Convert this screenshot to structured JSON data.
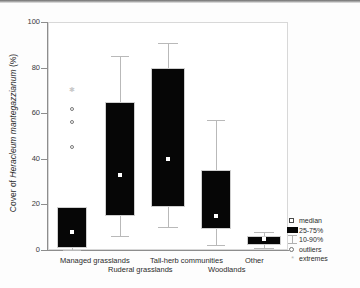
{
  "chart_data": {
    "type": "box",
    "title": "",
    "xlabel": "",
    "ylabel": "Cover of Heracleum mantegazzianum (%)",
    "ylabel_parts": {
      "prefix": "Cover of ",
      "italic": "Heracleum mantegazzianum",
      "suffix": " (%)"
    },
    "ylim": [
      0,
      100
    ],
    "yticks": [
      0,
      20,
      40,
      60,
      80,
      100
    ],
    "ytick_labels": [
      "0",
      "20",
      "40",
      "60",
      "80",
      "100"
    ],
    "grid": false,
    "legend_position": "right-bottom",
    "categories": [
      "Managed grasslands",
      "Ruderal grasslands",
      "Tall-herb communities",
      "Woodlands",
      "Other"
    ],
    "boxes": [
      {
        "category": "Managed grasslands",
        "median": 8,
        "q25": 1,
        "q75": 19,
        "p10": 0,
        "p90": 19,
        "outliers": [
          45,
          56,
          62
        ],
        "extremes": [
          70
        ]
      },
      {
        "category": "Ruderal grasslands",
        "median": 33,
        "q25": 15,
        "q75": 65,
        "p10": 6,
        "p90": 85,
        "outliers": [],
        "extremes": []
      },
      {
        "category": "Tall-herb communities",
        "median": 40,
        "q25": 19,
        "q75": 80,
        "p10": 10,
        "p90": 91,
        "outliers": [],
        "extremes": []
      },
      {
        "category": "Woodlands",
        "median": 15,
        "q25": 9,
        "q75": 35,
        "p10": 2,
        "p90": 57,
        "outliers": [],
        "extremes": []
      },
      {
        "category": "Other",
        "median": 5,
        "q25": 2,
        "q75": 6,
        "p10": 1,
        "p90": 8,
        "outliers": [],
        "extremes": []
      }
    ],
    "legend": [
      {
        "label": "median",
        "symbol": "open-square"
      },
      {
        "label": "25-75%",
        "symbol": "filled-box"
      },
      {
        "label": "10-90%",
        "symbol": "whisker"
      },
      {
        "label": "outliers",
        "symbol": "open-circle"
      },
      {
        "label": "extremes",
        "symbol": "asterisk"
      }
    ],
    "colors": {
      "box_fill": "#060606",
      "median_marker": "#ffffff",
      "whisker": "#b9b9b9",
      "axis": "#8d8d8d",
      "background": "#ffffff"
    }
  }
}
